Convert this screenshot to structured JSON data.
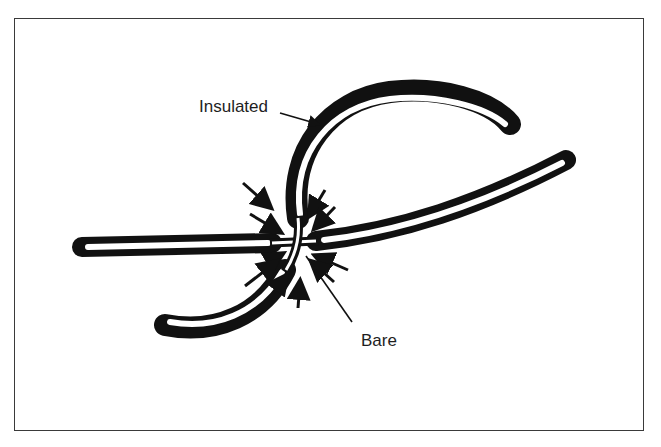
{
  "figure": {
    "type": "technical-illustration",
    "labels": {
      "insulated": "Insulated",
      "bare": "Bare"
    },
    "colors": {
      "ink": "#111111",
      "frame": "#3a3a3a",
      "background": "#ffffff"
    }
  }
}
